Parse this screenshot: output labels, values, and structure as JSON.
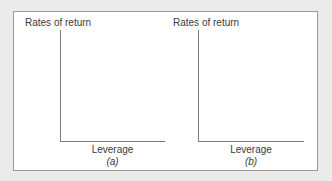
{
  "figure": {
    "background_color": "#ebebeb",
    "frame_color": "#9a9a9a",
    "axis_color": "#7d7d7d",
    "text_color": "#3a3a3a",
    "panels": [
      {
        "id": "a",
        "letter": "(a)",
        "y_axis_label": "Rates of return",
        "x_axis_label": "Leverage"
      },
      {
        "id": "b",
        "letter": "(b)",
        "y_axis_label": "Rates of return",
        "x_axis_label": "Leverage"
      }
    ]
  },
  "chart_data": [
    {
      "type": "line",
      "title": "",
      "subtitle": "(a)",
      "xlabel": "Leverage",
      "ylabel": "Rates of return",
      "series": [],
      "x": [],
      "values": [],
      "grid": false,
      "legend": "none",
      "notes": "Empty axes template: only the L-shaped y and x axis lines are drawn; no data plotted."
    },
    {
      "type": "line",
      "title": "",
      "subtitle": "(b)",
      "xlabel": "Leverage",
      "ylabel": "Rates of return",
      "series": [],
      "x": [],
      "values": [],
      "grid": false,
      "legend": "none",
      "notes": "Empty axes template: only the L-shaped y and x axis lines are drawn; no data plotted."
    }
  ]
}
